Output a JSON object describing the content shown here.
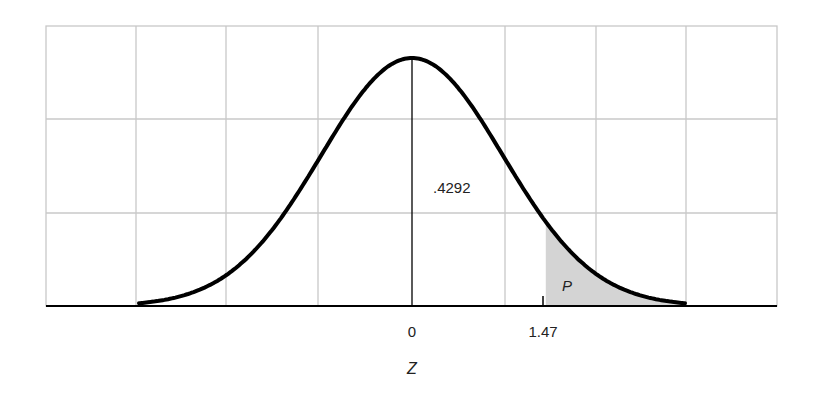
{
  "chart_data": {
    "type": "area",
    "title": "",
    "xlabel": "Z",
    "ylabel": "",
    "distribution": "standard normal",
    "x_ticks": [
      {
        "value": 0,
        "label": "0"
      },
      {
        "value": 1.47,
        "label": "1.47"
      }
    ],
    "annotations": [
      {
        "text": ".4292",
        "meaning": "area between 0 and 1.47"
      },
      {
        "text": "P",
        "meaning": "shaded upper tail area beyond z = 1.47"
      }
    ],
    "shaded_region": {
      "from": 1.47,
      "to": 3.0
    },
    "xlim": [
      -4,
      4
    ],
    "grid": true,
    "grid_columns": 8,
    "grid_rows": 3,
    "legend": "none"
  },
  "labels": {
    "area_value": ".4292",
    "tail_label": "P",
    "tick_zero": "0",
    "tick_z": "1.47",
    "axis_label": "Z"
  },
  "colors": {
    "curve": "#000000",
    "grid": "#c8c8c8",
    "shade": "#d4d4d4",
    "axis": "#000000"
  }
}
